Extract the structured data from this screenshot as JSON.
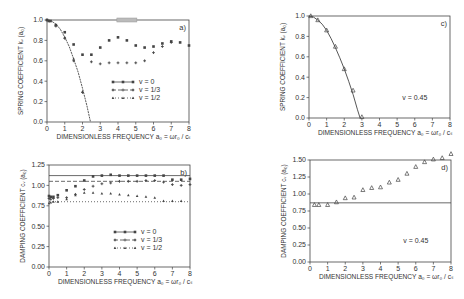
{
  "chart_data": [
    {
      "id": "a",
      "type": "scatter",
      "panel_label": "a)",
      "title": "",
      "xlabel": "DIMENSIONLESS FREQUENCY  a₀ = ωr₀ / cₛ",
      "ylabel": "SPRING COEFFICIENT  kᵥ (a₀)",
      "xlim": [
        0,
        8
      ],
      "ylim": [
        0,
        1.0
      ],
      "xticks": [
        "0",
        "1",
        "2",
        "3",
        "4",
        "5",
        "6",
        "7",
        "8"
      ],
      "yticks": [
        "0.0",
        "0.2",
        "0.4",
        "0.6",
        "0.8",
        "1.0"
      ],
      "ytick_values": [
        0,
        0.2,
        0.4,
        0.6,
        0.8,
        1.0
      ],
      "frame": {
        "x0": 47,
        "x1": 189,
        "y0": 20,
        "y1": 122
      },
      "legend": [
        {
          "label": "v = 0",
          "style": "solid"
        },
        {
          "label": "v = 1/3",
          "style": "dashed"
        },
        {
          "label": "v = 1/2",
          "style": "dotted"
        }
      ],
      "legend_pos": {
        "x": 112,
        "y": 82
      },
      "curve": {
        "name": "analytical",
        "x": [
          0,
          0.25,
          0.5,
          0.75,
          1.0,
          1.25,
          1.5,
          1.75,
          2.0,
          2.25,
          2.45
        ],
        "y": [
          1.0,
          0.99,
          0.96,
          0.91,
          0.83,
          0.74,
          0.62,
          0.49,
          0.33,
          0.16,
          0.0
        ],
        "style": "solid"
      },
      "series": [
        {
          "name": "v = 0",
          "x": [
            0,
            0.1,
            0.2,
            0.5,
            1.0,
            1.5,
            2.0,
            2.5,
            3.0,
            3.5,
            4.0,
            4.5,
            5.0,
            5.5,
            6.0,
            6.5,
            7.0,
            7.5,
            8.0
          ],
          "y": [
            1.0,
            0.99,
            0.99,
            0.95,
            0.88,
            0.76,
            0.66,
            0.66,
            0.73,
            0.8,
            0.83,
            0.8,
            0.75,
            0.73,
            0.74,
            0.77,
            0.79,
            0.78,
            0.75
          ]
        },
        {
          "name": "v = 1/3",
          "x": [
            0,
            0.5,
            1.0,
            1.5,
            2.0,
            2.5,
            3.0,
            3.5,
            4.0,
            4.5,
            5.0,
            5.5,
            6.0,
            6.5,
            7.0
          ],
          "y": [
            1.0,
            0.94,
            0.82,
            0.6,
            0.29,
            0.59,
            0.57,
            0.58,
            0.58,
            0.58,
            0.58,
            0.6,
            0.68,
            0.74,
            0.78
          ]
        },
        {
          "name": "v = 1/2",
          "x": [
            0,
            0.5,
            1.0,
            1.5,
            2.0
          ],
          "y": [
            1.0,
            0.95,
            0.83,
            0.62,
            0.3
          ]
        }
      ],
      "annotations": [
        {
          "type": "grey-box",
          "x": 4.5,
          "y": 1.0
        }
      ]
    },
    {
      "id": "b",
      "type": "scatter",
      "panel_label": "b)",
      "title": "",
      "xlabel": "DIMENSIONLESS FREQUENCY  a₀ = ωr₀ / cₛ",
      "ylabel": "DAMPING COEFFICIENT  cᵥ (a₀)",
      "xlim": [
        0,
        8
      ],
      "ylim": [
        0,
        1.25
      ],
      "xticks": [
        "0",
        "1",
        "2",
        "3",
        "4",
        "5",
        "6",
        "7",
        "8"
      ],
      "yticks": [
        "0.00",
        "0.25",
        "0.50",
        "0.75",
        "1.00",
        "1.25"
      ],
      "ytick_values": [
        0,
        0.25,
        0.5,
        0.75,
        1.0,
        1.25
      ],
      "frame": {
        "x0": 49,
        "x1": 190,
        "y0": 165,
        "y1": 267
      },
      "legend": [
        {
          "label": "v = 0",
          "style": "solid"
        },
        {
          "label": "v = 1/3",
          "style": "dashed"
        },
        {
          "label": "v = 1/2",
          "style": "dotted"
        }
      ],
      "legend_pos": {
        "x": 114,
        "y": 232
      },
      "hlines": [
        {
          "name": "v = 0",
          "y": 1.12,
          "style": "solid"
        },
        {
          "name": "v = 1/3",
          "y": 1.05,
          "style": "dashed"
        },
        {
          "name": "v = 1/2",
          "y": 0.8,
          "style": "dotted"
        }
      ],
      "series": [
        {
          "name": "v = 0",
          "x": [
            0,
            0.1,
            0.25,
            0.5,
            1.0,
            1.5,
            2.0,
            2.5,
            3.0,
            3.5,
            4.0,
            4.5,
            5.0,
            5.5,
            6.0,
            6.5,
            7.0,
            7.5,
            8.0
          ],
          "y": [
            0.87,
            0.86,
            0.86,
            0.88,
            0.94,
            0.99,
            1.06,
            1.11,
            1.12,
            1.13,
            1.12,
            1.12,
            1.12,
            1.12,
            1.12,
            1.12,
            1.07,
            1.07,
            1.08
          ]
        },
        {
          "name": "v = 1/3",
          "x": [
            0,
            0.1,
            0.25,
            0.5,
            1.0,
            1.5,
            2.0,
            2.5,
            3.0,
            3.5,
            4.0,
            4.5,
            5.0,
            5.5,
            6.0,
            6.5,
            7.0,
            7.5,
            8.0
          ],
          "y": [
            0.84,
            0.83,
            0.84,
            0.85,
            0.85,
            0.89,
            0.95,
            0.99,
            1.02,
            1.03,
            1.05,
            1.05,
            1.05,
            1.06,
            1.06,
            1.04,
            1.01,
            1.0,
            1.01
          ]
        },
        {
          "name": "v = 1/2",
          "x": [
            0,
            0.1,
            0.25,
            0.5,
            1.0,
            1.5,
            2.0,
            2.5,
            3.0,
            3.5,
            4.0,
            4.5,
            5.0,
            5.5,
            6.0,
            6.5,
            7.0,
            7.5
          ],
          "y": [
            0.78,
            0.79,
            0.8,
            0.8,
            0.83,
            0.88,
            0.91,
            0.91,
            0.9,
            0.9,
            0.89,
            0.88,
            0.87,
            0.86,
            0.85,
            0.81,
            0.81,
            0.81
          ]
        }
      ]
    },
    {
      "id": "c",
      "type": "scatter",
      "panel_label": "c)",
      "title": "",
      "xlabel": "DIMENSIONLESS FREQUENCY  a₀ = ωr₀ / cₛ",
      "ylabel": "SPRING COEFFICIENT  kᵥ (a₀)",
      "xlim": [
        0,
        8
      ],
      "ylim": [
        0,
        1.0
      ],
      "xticks": [
        "0",
        "1",
        "2",
        "3",
        "4",
        "5",
        "6",
        "7",
        "8"
      ],
      "yticks": [
        "0.0",
        "0.2",
        "0.4",
        "0.6",
        "0.8",
        "1.0"
      ],
      "ytick_values": [
        0,
        0.2,
        0.4,
        0.6,
        0.8,
        1.0
      ],
      "frame": {
        "x0": 309,
        "x1": 450,
        "y0": 16,
        "y1": 118
      },
      "note": "v = 0.45",
      "note_pos": {
        "x": 6.0,
        "y": 0.18
      },
      "curve": {
        "name": "analytical",
        "x": [
          0,
          0.25,
          0.5,
          0.75,
          1.0,
          1.25,
          1.5,
          1.75,
          2.0,
          2.25,
          2.5,
          2.75,
          2.9
        ],
        "y": [
          1.0,
          0.99,
          0.96,
          0.92,
          0.86,
          0.78,
          0.69,
          0.59,
          0.48,
          0.36,
          0.23,
          0.08,
          0.0
        ],
        "style": "solid"
      },
      "series": [
        {
          "name": "v = 0.45",
          "marker": "triangle",
          "x": [
            0.1,
            0.5,
            1.0,
            1.5,
            2.0,
            2.5,
            3.0
          ],
          "y": [
            1.0,
            0.96,
            0.86,
            0.7,
            0.48,
            0.27,
            0.01
          ]
        }
      ]
    },
    {
      "id": "d",
      "type": "scatter",
      "panel_label": "d)",
      "title": "",
      "xlabel": "DIMENSIONLESS FREQUENCY  a₀ = ωr₀ / cₛ",
      "ylabel": "DAMPING COEFFICIENT  cᵥ (a₀)",
      "xlim": [
        0,
        8
      ],
      "ylim": [
        0,
        1.5
      ],
      "xticks": [
        "0",
        "1",
        "2",
        "3",
        "4",
        "5",
        "6",
        "7",
        "8"
      ],
      "yticks": [
        "0.00",
        "0.25",
        "0.50",
        "0.75",
        "1.00",
        "1.25",
        "1.50"
      ],
      "ytick_values": [
        0,
        0.25,
        0.5,
        0.75,
        1.0,
        1.25,
        1.5
      ],
      "frame": {
        "x0": 310,
        "x1": 451,
        "y0": 160,
        "y1": 262
      },
      "note": "v = 0.45",
      "note_pos": {
        "x": 6.0,
        "y": 0.28
      },
      "hlines": [
        {
          "name": "analytical",
          "y": 0.87,
          "style": "solid"
        }
      ],
      "series": [
        {
          "name": "v = 0.45",
          "marker": "triangle",
          "x": [
            0.25,
            0.5,
            1.0,
            1.5,
            2.0,
            2.5,
            3.0,
            3.5,
            4.0,
            4.5,
            5.0,
            5.5,
            6.0,
            6.5,
            7.0,
            7.5,
            8.0
          ],
          "y": [
            0.84,
            0.84,
            0.84,
            0.88,
            0.94,
            0.95,
            1.06,
            1.09,
            1.1,
            1.17,
            1.21,
            1.3,
            1.4,
            1.47,
            1.51,
            1.53,
            1.59
          ]
        }
      ]
    }
  ]
}
